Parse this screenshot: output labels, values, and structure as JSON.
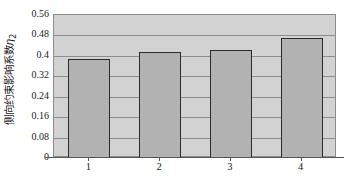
{
  "chart_data": {
    "type": "bar",
    "title": "",
    "subtitle": "",
    "xlabel": "",
    "ylabel": "侧向约束影响系数η₂",
    "ylabel_main": "侧向约束影响系数",
    "ylabel_symbol": "η",
    "ylabel_subscript": "2",
    "categories": [
      "1",
      "2",
      "3",
      "4"
    ],
    "values": [
      0.387,
      0.417,
      0.422,
      0.47
    ],
    "series": [
      {
        "name": "侧向约束影响系数η₂",
        "values": [
          0.387,
          0.417,
          0.422,
          0.47
        ]
      }
    ],
    "ylim": [
      0,
      0.56
    ],
    "yticks": [
      0,
      0.08,
      0.16,
      0.24,
      0.32,
      0.4,
      0.48,
      0.56
    ],
    "ytick_labels": [
      "0",
      "0.08",
      "0.16",
      "0.24",
      "0.32",
      "0.4",
      "0.48",
      "0.56"
    ],
    "xtick_labels": [
      "1",
      "2",
      "3",
      "4"
    ],
    "grid": "horizontal",
    "legend": "none",
    "colors": {
      "bar_fill": "#b2b2b2",
      "bar_edge": "#2b2b2b",
      "plot_background": "#d2d2d2",
      "gridline": "#8d8d8d",
      "axis": "#555555",
      "text": "#1a1a1a",
      "figure_background": "#ffffff"
    }
  }
}
